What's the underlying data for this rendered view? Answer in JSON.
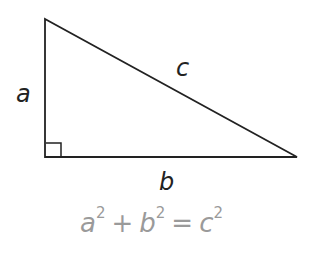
{
  "diagram": {
    "labels": {
      "a": "a",
      "b": "b",
      "c": "c"
    },
    "equation": {
      "terms": [
        {
          "base": "a",
          "exp": "2"
        },
        {
          "op": "+"
        },
        {
          "base": "b",
          "exp": "2"
        },
        {
          "op": "="
        },
        {
          "base": "c",
          "exp": "2"
        }
      ],
      "color": "#9a9a9a"
    },
    "stroke_color": "#222222"
  }
}
